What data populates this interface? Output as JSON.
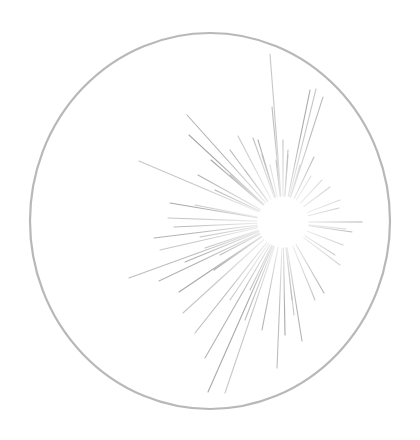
{
  "drawing": {
    "title": "Starburst in circle sketch",
    "background": "#ffffff",
    "circle": {
      "cx": 210,
      "cy": 221,
      "rx": 180,
      "ry": 188,
      "stroke": "#b8b8b8",
      "stroke_width": 2.2
    },
    "burst": {
      "center": [
        283,
        222
      ],
      "inner_radius": 26,
      "stroke": "#9a9a9a",
      "stroke_width": 1.1,
      "rays": [
        [
          270,
          54
        ],
        [
          272,
          107
        ],
        [
          288,
          150
        ],
        [
          310,
          90
        ],
        [
          316,
          89
        ],
        [
          323,
          97
        ],
        [
          187,
          115
        ],
        [
          189,
          135
        ],
        [
          238,
          136
        ],
        [
          253,
          138
        ],
        [
          230,
          150
        ],
        [
          211,
          160
        ],
        [
          139,
          161
        ],
        [
          283,
          140
        ],
        [
          288,
          155
        ],
        [
          314,
          157
        ],
        [
          311,
          176
        ],
        [
          330,
          187
        ],
        [
          339,
          208
        ],
        [
          170,
          203
        ],
        [
          168,
          218
        ],
        [
          174,
          227
        ],
        [
          154,
          238
        ],
        [
          362,
          222
        ],
        [
          346,
          229
        ],
        [
          129,
          278
        ],
        [
          159,
          281
        ],
        [
          179,
          292
        ],
        [
          183,
          313
        ],
        [
          195,
          333
        ],
        [
          205,
          358
        ],
        [
          208,
          392
        ],
        [
          225,
          393
        ],
        [
          277,
          368
        ],
        [
          302,
          341
        ],
        [
          324,
          293
        ],
        [
          340,
          265
        ],
        [
          343,
          245
        ],
        [
          262,
          155
        ],
        [
          276,
          160
        ],
        [
          300,
          165
        ],
        [
          322,
          180
        ],
        [
          198,
          175
        ],
        [
          215,
          190
        ],
        [
          195,
          205
        ],
        [
          200,
          237
        ],
        [
          185,
          262
        ],
        [
          214,
          270
        ],
        [
          230,
          300
        ],
        [
          245,
          320
        ],
        [
          262,
          330
        ],
        [
          285,
          335
        ],
        [
          294,
          315
        ],
        [
          315,
          300
        ],
        [
          335,
          255
        ],
        [
          352,
          232
        ],
        [
          340,
          200
        ],
        [
          245,
          170
        ],
        [
          230,
          175
        ],
        [
          258,
          140
        ],
        [
          270,
          165
        ],
        [
          292,
          300
        ],
        [
          250,
          290
        ],
        [
          220,
          255
        ],
        [
          160,
          250
        ],
        [
          205,
          248
        ]
      ]
    }
  }
}
